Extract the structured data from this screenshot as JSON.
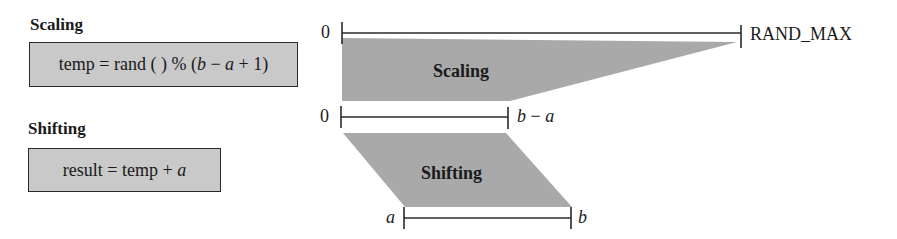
{
  "left_panel": {
    "scaling": {
      "title": "Scaling",
      "formula_parts": [
        "temp = rand ( ) % (",
        "b",
        " − ",
        "a",
        " + 1)"
      ]
    },
    "shifting": {
      "title": "Shifting",
      "formula_parts": [
        "result = temp + ",
        "a"
      ]
    }
  },
  "diagram": {
    "top_range": {
      "start_label": "0",
      "end_label": "RAND_MAX"
    },
    "scaling_shape_label": "Scaling",
    "middle_range": {
      "start_label": "0",
      "end_label_parts": [
        "b",
        " − ",
        "a"
      ]
    },
    "shifting_shape_label": "Shifting",
    "bottom_range": {
      "start_label": "a",
      "end_label": "b"
    },
    "colors": {
      "fill": "#a9a9a9",
      "box_fill": "#c9c9c9",
      "line": "#2a2a2a"
    }
  }
}
